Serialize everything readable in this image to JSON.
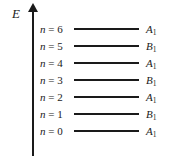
{
  "diagram": {
    "axis": {
      "label": "E",
      "name": "energy-axis",
      "direction": "up"
    },
    "equals_sign": "=",
    "quantum_symbol": "n",
    "levels": [
      {
        "n_label": "n = 6",
        "n_value": "6",
        "symmetry": "A",
        "subscript": "1",
        "y": 29
      },
      {
        "n_label": "n = 5",
        "n_value": "5",
        "symmetry": "B",
        "subscript": "1",
        "y": 46
      },
      {
        "n_label": "n = 4",
        "n_value": "4",
        "symmetry": "A",
        "subscript": "1",
        "y": 63
      },
      {
        "n_label": "n = 3",
        "n_value": "3",
        "symmetry": "B",
        "subscript": "1",
        "y": 80
      },
      {
        "n_label": "n = 2",
        "n_value": "2",
        "symmetry": "A",
        "subscript": "1",
        "y": 97
      },
      {
        "n_label": "n = 1",
        "n_value": "1",
        "symmetry": "B",
        "subscript": "1",
        "y": 114
      },
      {
        "n_label": "n = 0",
        "n_value": "0",
        "symmetry": "A",
        "subscript": "1",
        "y": 131
      }
    ],
    "colors": {
      "ink": "#1a1a1a",
      "background": "#ffffff"
    }
  }
}
